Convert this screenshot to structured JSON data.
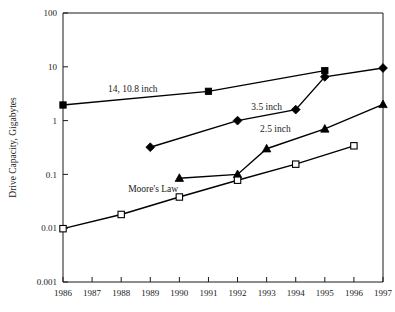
{
  "chart_data": {
    "type": "line",
    "title": "",
    "xlabel": "",
    "ylabel": "Drive Capacity, Gigabytes",
    "yscale": "log",
    "ylim": [
      0.001,
      100
    ],
    "xlim": [
      1986,
      1997
    ],
    "grid": false,
    "legend_position": "inline-annotations",
    "ytick_labels": [
      "100",
      "10",
      "1",
      "0.1",
      "0.01",
      "0.001"
    ],
    "ytick_values": [
      100,
      10,
      1,
      0.1,
      0.01,
      0.001
    ],
    "xtick_labels": [
      "1986",
      "1987",
      "1988",
      "1989",
      "1990",
      "1991",
      "1992",
      "1993",
      "1994",
      "1995",
      "1996",
      "1997"
    ],
    "xtick_values": [
      1986,
      1987,
      1988,
      1989,
      1990,
      1991,
      1992,
      1993,
      1994,
      1995,
      1996,
      1997
    ],
    "series": [
      {
        "name": "14, 10.8 inch",
        "marker": "filled-square",
        "annotation": "14, 10.8 inch",
        "x": [
          1986,
          1991,
          1995
        ],
        "values": [
          1.95,
          3.5,
          8.5
        ]
      },
      {
        "name": "3.5 inch",
        "marker": "filled-diamond",
        "annotation": "3.5 inch",
        "x": [
          1989,
          1992,
          1994,
          1995,
          1997
        ],
        "values": [
          0.32,
          1.0,
          1.6,
          6.5,
          9.5
        ]
      },
      {
        "name": "2.5 inch",
        "marker": "filled-triangle",
        "annotation": "2.5 inch",
        "x": [
          1990,
          1992,
          1993,
          1995,
          1997
        ],
        "values": [
          0.085,
          0.1,
          0.3,
          0.7,
          2.0
        ]
      },
      {
        "name": "Moore's Law",
        "marker": "open-square",
        "annotation": "Moore's Law",
        "x": [
          1986,
          1988,
          1990,
          1992,
          1994,
          1996
        ],
        "values": [
          0.0098,
          0.018,
          0.038,
          0.078,
          0.155,
          0.34
        ]
      }
    ],
    "annotations": [
      {
        "text": "14, 10.8 inch",
        "x": 1988.4,
        "y": 3.35
      },
      {
        "text": "3.5 inch",
        "x": 1993.0,
        "y": 1.55
      },
      {
        "text": "2.5 inch",
        "x": 1993.3,
        "y": 0.62
      },
      {
        "text": "Moore's Law",
        "x": 1989.1,
        "y": 0.047
      }
    ]
  },
  "colors": {
    "axis": "#1a1a1a",
    "series": "#000000",
    "background": "#ffffff"
  }
}
